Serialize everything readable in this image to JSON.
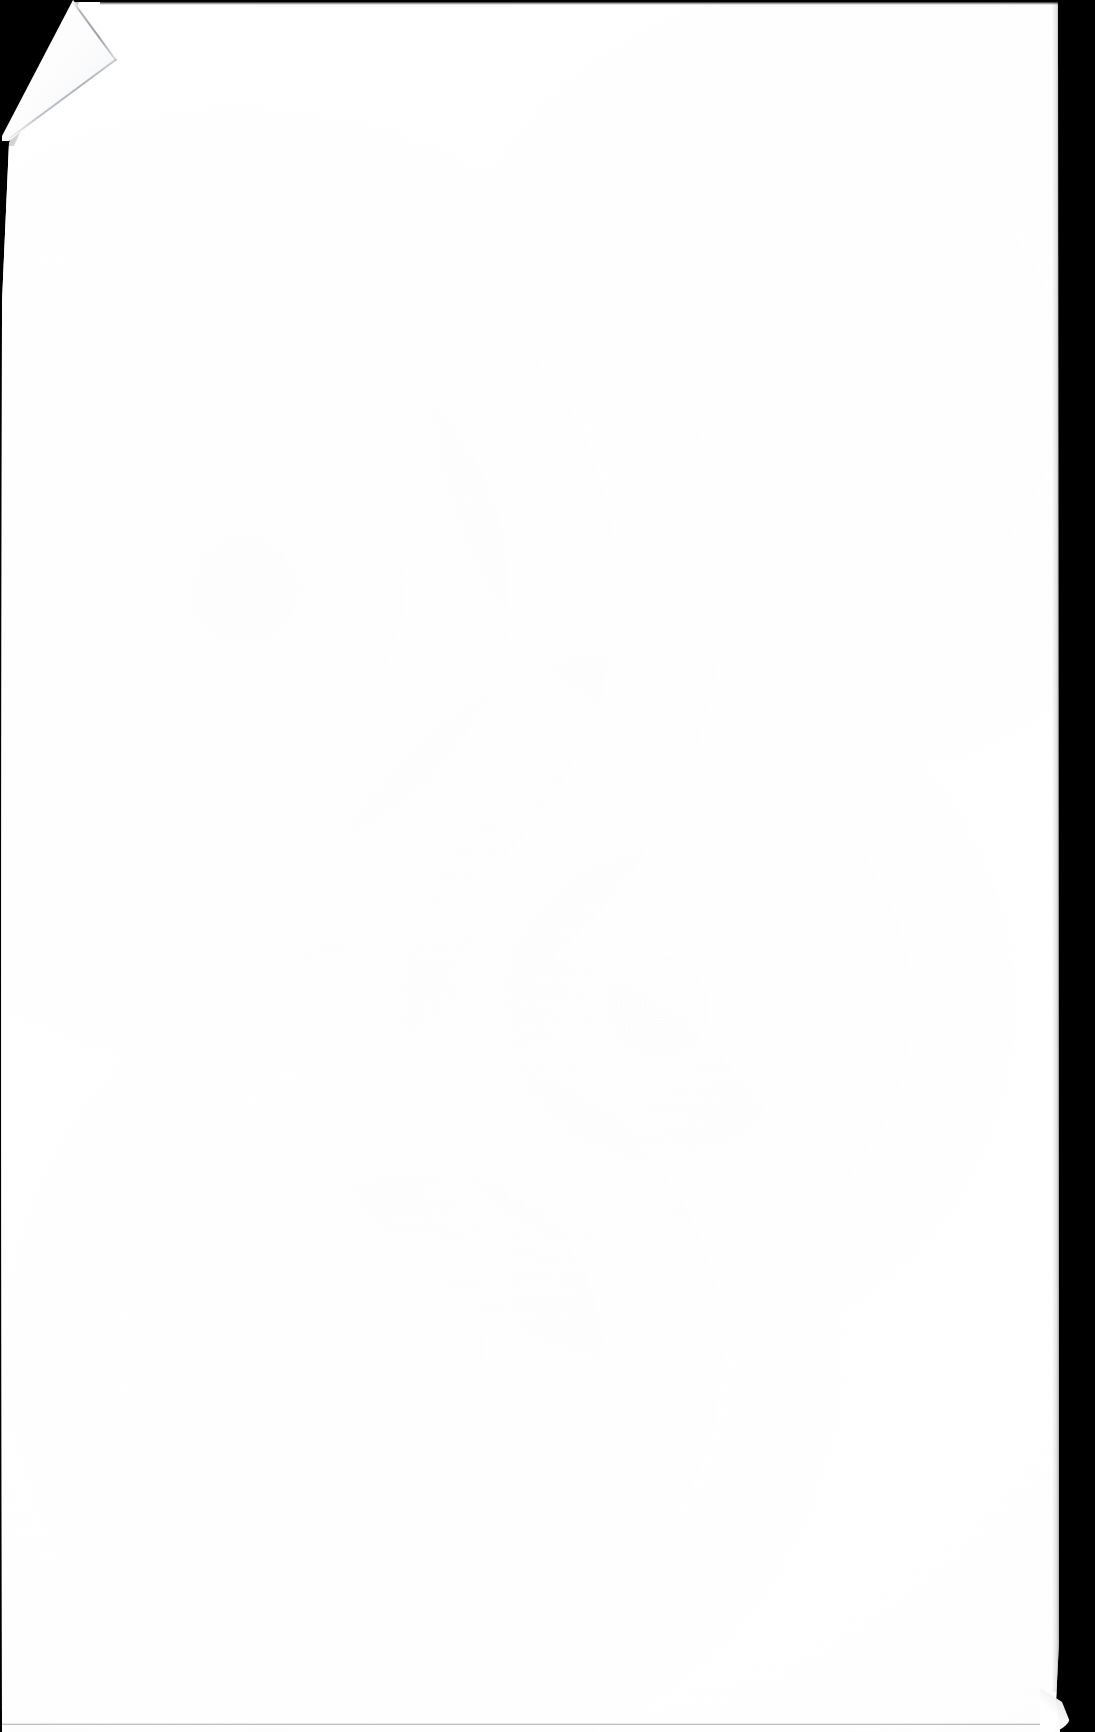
{
  "document": {
    "kind": "scanned-page-image",
    "page_content_text": "",
    "page_is_blank": true,
    "visible_text_blocks": [],
    "annotations": [],
    "page_number_label": "",
    "header_text": "",
    "footer_text": ""
  },
  "scan": {
    "image_width": 1095,
    "image_height": 1732,
    "backdrop_color": "#000000",
    "paper_color": "#ffffff",
    "edge_line_color": "#3c4048",
    "crease_shadow_color": "#8a8f98",
    "paper_left_px": 0,
    "paper_top_px": 2,
    "paper_right_px": 1059,
    "paper_bottom_px": 1732
  },
  "features": {
    "corner_fold": {
      "name": "dog-eared-top-left-corner",
      "apex_top_x": 73,
      "fold_tip_x": 117,
      "fold_tip_y": 60,
      "fold_end_x": 9,
      "fold_end_y": 141
    },
    "bottom_right_curl": {
      "name": "bottom-right-paper-curl",
      "x": 1040,
      "y": 1688,
      "width": 32,
      "height": 44
    },
    "edges": {
      "top_edge_line": true,
      "bottom_edge_line": true,
      "left_edge_line": true,
      "right_edge_feather": true
    }
  }
}
